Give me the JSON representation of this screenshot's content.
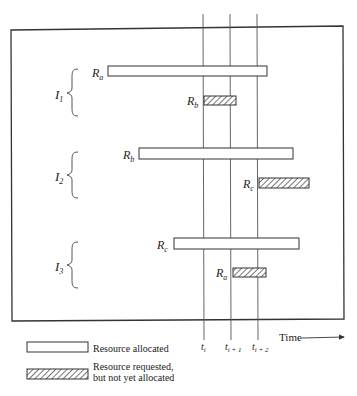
{
  "diagram": {
    "time_axis": {
      "label": "Time",
      "ticks": [
        {
          "base": "t",
          "sub": "i",
          "x": 203
        },
        {
          "base": "t",
          "sub": "i + 1",
          "x": 230
        },
        {
          "base": "t",
          "sub": "i + 2",
          "x": 257
        }
      ]
    },
    "processes": [
      {
        "name": "I",
        "sub": "1",
        "allocated": {
          "resource": "R",
          "sub": "a",
          "x1": 108,
          "x2": 267,
          "y": 66
        },
        "requested": {
          "resource": "R",
          "sub": "b",
          "x1": 204,
          "x2": 236,
          "y": 96
        }
      },
      {
        "name": "I",
        "sub": "2",
        "allocated": {
          "resource": "R",
          "sub": "b",
          "x1": 139,
          "x2": 293,
          "y": 148
        },
        "requested": {
          "resource": "R",
          "sub": "c",
          "x1": 259,
          "x2": 309,
          "y": 178
        }
      },
      {
        "name": "I",
        "sub": "3",
        "allocated": {
          "resource": "R",
          "sub": "c",
          "x1": 174,
          "x2": 299,
          "y": 238
        },
        "requested": {
          "resource": "R",
          "sub": "a",
          "x1": 233,
          "x2": 266,
          "y": 268
        }
      }
    ],
    "legend": [
      {
        "type": "allocated",
        "line1": "Resource allocated",
        "line2": ""
      },
      {
        "type": "requested",
        "line1": "Resource requested,",
        "line2": "but not yet allocated"
      }
    ]
  }
}
